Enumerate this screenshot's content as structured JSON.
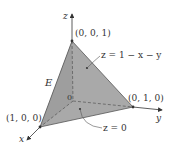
{
  "figure": {
    "type": "3d-tetrahedron-region",
    "colors": {
      "face_fill": "#a9a9a9",
      "edge": "#444444",
      "axis": "#333333",
      "text": "#333333"
    },
    "axes": {
      "x_label": "x",
      "y_label": "y",
      "z_label": "z"
    },
    "points": {
      "top": "(0, 0, 1)",
      "y_intercept": "(0, 1, 0)",
      "x_intercept": "(1, 0, 0)",
      "origin": "0"
    },
    "annotations": {
      "top_surface": "z = 1 − x − y",
      "bottom_surface": "z = 0",
      "region": "E"
    }
  }
}
